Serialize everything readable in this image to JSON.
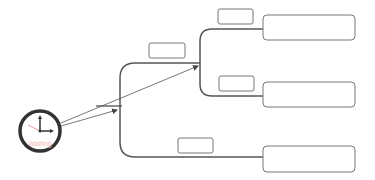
{
  "diagram": {
    "type": "tree-flow",
    "colors": {
      "line": "#555555",
      "box_border": "#777777",
      "clock_ring": "#333333",
      "clock_label": "#f0b5b5",
      "clock_second_hand": "#e8a0a0"
    },
    "start_node": {
      "icon": "clock-icon",
      "label": "Waiting"
    },
    "branch_labels": [
      {
        "id": "label-upper-trunk",
        "text": ""
      },
      {
        "id": "label-top-branch",
        "text": ""
      },
      {
        "id": "label-middle-branch",
        "text": ""
      },
      {
        "id": "label-bottom-branch",
        "text": ""
      }
    ],
    "end_nodes": [
      {
        "id": "node-top",
        "text": ""
      },
      {
        "id": "node-middle",
        "text": ""
      },
      {
        "id": "node-bottom",
        "text": ""
      }
    ]
  }
}
